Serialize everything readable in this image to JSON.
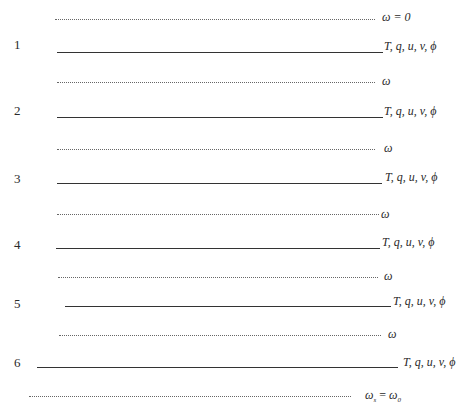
{
  "diagram": {
    "title": "",
    "top_boundary_label": "ω = 0",
    "bottom_boundary_label": "ω_s = ω_0",
    "bottom_boundary": {
      "main": "ω",
      "sub1": "s",
      "eq": " = ",
      "main2": "ω",
      "sub2": "0"
    },
    "interface_label": "ω",
    "layers": [
      {
        "index": "1",
        "label": "T, q, u, v, ϕ"
      },
      {
        "index": "2",
        "label": "T, q, u, v, ϕ"
      },
      {
        "index": "3",
        "label": "T, q, u, v, ϕ"
      },
      {
        "index": "4",
        "label": "T, q, u, v, ϕ"
      },
      {
        "index": "5",
        "label": "T, q, u, v, ϕ"
      },
      {
        "index": "6",
        "label": "T, q, u, v, ϕ"
      }
    ],
    "interfaces": [
      "ω",
      "ω",
      "ω",
      "ω",
      "ω"
    ]
  }
}
